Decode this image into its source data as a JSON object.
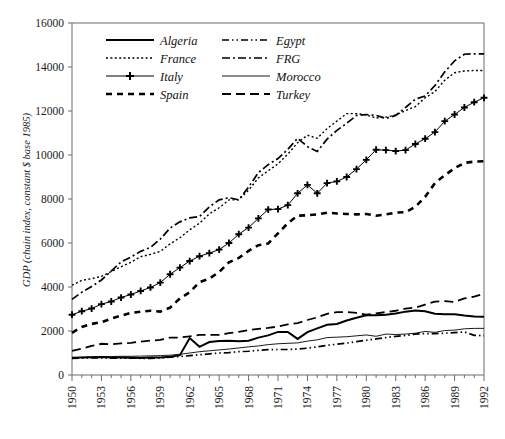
{
  "chart_data": {
    "type": "line",
    "title": "",
    "xlabel": "",
    "ylabel": "GDP (chain index, constant $ base 1985)",
    "xlim": [
      1950,
      1992
    ],
    "ylim": [
      0,
      16000
    ],
    "y_ticks": [
      0,
      2000,
      4000,
      6000,
      8000,
      10000,
      12000,
      14000,
      16000
    ],
    "y_tick_labels": [
      "0",
      "2000",
      "4000",
      "6000",
      "8000",
      "10000",
      "12000",
      "14000",
      "16000"
    ],
    "x_ticks": [
      1950,
      1953,
      1956,
      1959,
      1962,
      1965,
      1968,
      1971,
      1974,
      1977,
      1980,
      1983,
      1986,
      1989,
      1992
    ],
    "x_tick_labels": [
      "1950",
      "1953",
      "1956",
      "1959",
      "1962",
      "1965",
      "1968",
      "1971",
      "1974",
      "1977",
      "1980",
      "1983",
      "1986",
      "1989",
      "1992"
    ],
    "x_minor_tick_step": 1,
    "grid": false,
    "legend_position": "top-left-inside",
    "legend_columns": 2,
    "x": [
      1950,
      1951,
      1952,
      1953,
      1954,
      1955,
      1956,
      1957,
      1958,
      1959,
      1960,
      1961,
      1962,
      1963,
      1964,
      1965,
      1966,
      1967,
      1968,
      1969,
      1970,
      1971,
      1972,
      1973,
      1974,
      1975,
      1976,
      1977,
      1978,
      1979,
      1980,
      1981,
      1982,
      1983,
      1984,
      1985,
      1986,
      1987,
      1988,
      1989,
      1990,
      1991,
      1992
    ],
    "series": [
      {
        "name": "Algeria",
        "style": "solid",
        "stroke_width": 2.0,
        "dash": "none",
        "marker": "none",
        "values": [
          780,
          800,
          810,
          820,
          800,
          790,
          780,
          770,
          790,
          800,
          830,
          900,
          1680,
          1280,
          1500,
          1550,
          1560,
          1530,
          1560,
          1700,
          1800,
          1960,
          1960,
          1640,
          1950,
          2120,
          2280,
          2320,
          2480,
          2600,
          2720,
          2720,
          2740,
          2800,
          2880,
          2930,
          2900,
          2780,
          2760,
          2760,
          2700,
          2660,
          2650
        ]
      },
      {
        "name": "France",
        "style": "dotted",
        "stroke_width": 1.4,
        "dash": "2,2.4",
        "marker": "none",
        "values": [
          4080,
          4300,
          4380,
          4480,
          4700,
          4920,
          5120,
          5380,
          5480,
          5620,
          5960,
          6240,
          6600,
          6900,
          7320,
          7600,
          7960,
          7960,
          8400,
          8960,
          9280,
          9600,
          10040,
          10560,
          10900,
          10760,
          11200,
          11540,
          11880,
          11880,
          11820,
          11680,
          11720,
          11820,
          12020,
          12200,
          12600,
          12880,
          13400,
          13740,
          13820,
          13840,
          13840
        ]
      },
      {
        "name": "Italy",
        "style": "solid-plus",
        "stroke_width": 1.0,
        "dash": "none",
        "marker": "plus",
        "values": [
          2740,
          2900,
          3020,
          3220,
          3340,
          3520,
          3660,
          3820,
          3980,
          4200,
          4580,
          4880,
          5180,
          5400,
          5540,
          5700,
          6000,
          6400,
          6700,
          7120,
          7520,
          7540,
          7720,
          8260,
          8640,
          8260,
          8720,
          8800,
          9000,
          9360,
          9780,
          10240,
          10220,
          10180,
          10220,
          10500,
          10740,
          11040,
          11540,
          11840,
          12160,
          12400,
          12600
        ]
      },
      {
        "name": "Spain",
        "style": "dashed-thick",
        "stroke_width": 2.6,
        "dash": "6,5",
        "marker": "none",
        "values": [
          1920,
          2180,
          2320,
          2400,
          2560,
          2700,
          2820,
          2880,
          2920,
          2880,
          3060,
          3480,
          3760,
          4220,
          4380,
          4680,
          5120,
          5320,
          5640,
          5900,
          5980,
          6440,
          6900,
          7240,
          7260,
          7300,
          7380,
          7340,
          7320,
          7300,
          7320,
          7240,
          7300,
          7380,
          7400,
          7640,
          8100,
          8720,
          9080,
          9400,
          9640,
          9700,
          9720
        ]
      },
      {
        "name": "Egypt",
        "style": "dash-dot-dot",
        "stroke_width": 1.7,
        "dash": "7,3,1.5,3,1.5,3",
        "marker": "none",
        "values": [
          760,
          770,
          780,
          775,
          770,
          770,
          770,
          760,
          760,
          770,
          810,
          840,
          880,
          920,
          960,
          1000,
          1020,
          1060,
          1080,
          1120,
          1150,
          1160,
          1160,
          1180,
          1220,
          1280,
          1350,
          1400,
          1450,
          1520,
          1580,
          1640,
          1700,
          1760,
          1800,
          1860,
          1880,
          1880,
          1900,
          1930,
          1960,
          1800,
          1790
        ]
      },
      {
        "name": "FRG",
        "style": "dash-dot",
        "stroke_width": 1.7,
        "dash": "8,3,2,3",
        "marker": "none",
        "values": [
          3440,
          3760,
          4020,
          4320,
          4720,
          5140,
          5360,
          5620,
          5800,
          6180,
          6680,
          6960,
          7140,
          7200,
          7640,
          7960,
          8060,
          7960,
          8540,
          9200,
          9560,
          9840,
          10260,
          10760,
          10380,
          10160,
          10720,
          11120,
          11440,
          11800,
          11840,
          11800,
          11660,
          11800,
          12160,
          12540,
          12680,
          13160,
          13780,
          14280,
          14580,
          14600,
          14600
        ]
      },
      {
        "name": "Morocco",
        "style": "solid-thin",
        "stroke_width": 0.9,
        "dash": "none",
        "marker": "none",
        "values": [
          790,
          800,
          820,
          830,
          840,
          850,
          850,
          860,
          870,
          880,
          900,
          940,
          1000,
          1060,
          1100,
          1140,
          1180,
          1230,
          1280,
          1320,
          1380,
          1420,
          1440,
          1460,
          1540,
          1600,
          1700,
          1720,
          1740,
          1780,
          1820,
          1760,
          1860,
          1840,
          1860,
          1900,
          1980,
          1940,
          2020,
          2040,
          2100,
          2120,
          2120
        ]
      },
      {
        "name": "Turkey",
        "style": "dashed",
        "stroke_width": 1.8,
        "dash": "9,5",
        "marker": "none",
        "values": [
          1100,
          1200,
          1320,
          1420,
          1400,
          1440,
          1460,
          1520,
          1560,
          1600,
          1700,
          1700,
          1760,
          1820,
          1820,
          1820,
          1900,
          1960,
          2040,
          2100,
          2140,
          2200,
          2300,
          2360,
          2500,
          2620,
          2780,
          2860,
          2860,
          2820,
          2740,
          2800,
          2860,
          2920,
          3020,
          3060,
          3200,
          3340,
          3360,
          3320,
          3480,
          3560,
          3700
        ]
      }
    ]
  },
  "legend": {
    "entries": [
      {
        "label": "Algeria",
        "series_index": 0
      },
      {
        "label": "Egypt",
        "series_index": 4
      },
      {
        "label": "France",
        "series_index": 1
      },
      {
        "label": "FRG",
        "series_index": 5
      },
      {
        "label": "Italy",
        "series_index": 2
      },
      {
        "label": "Morocco",
        "series_index": 6
      },
      {
        "label": "Spain",
        "series_index": 3
      },
      {
        "label": "Turkey",
        "series_index": 7
      }
    ]
  },
  "colors": {
    "ink": "#000000",
    "axis": "#6b6b6b",
    "background": "#ffffff"
  }
}
